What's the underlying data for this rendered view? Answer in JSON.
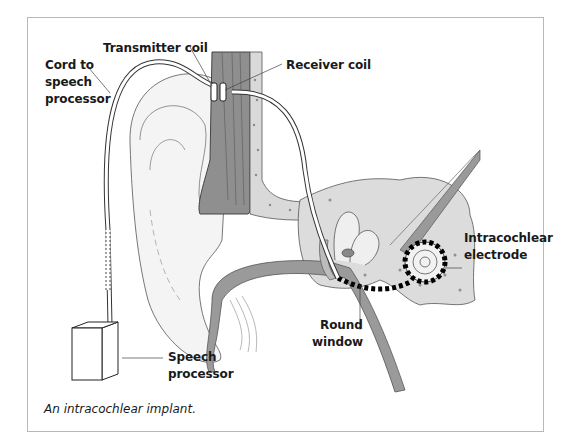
{
  "figure": {
    "caption": "An intracochlear implant.",
    "labels": {
      "transmitter_coil": "Transmitter coil",
      "receiver_coil": "Receiver coil",
      "cord_line1": "Cord to",
      "cord_line2": "speech",
      "cord_line3": "processor",
      "electrode_line1": "Intracochlear",
      "electrode_line2": "electrode",
      "round_window_line1": "Round",
      "round_window_line2": "window",
      "processor_line1": "Speech",
      "processor_line2": "processor"
    },
    "colors": {
      "bone": "#dcdcdc",
      "tissue": "#9a9a9a",
      "outline": "#4a4a4a",
      "border": "#b8b8b8"
    }
  }
}
